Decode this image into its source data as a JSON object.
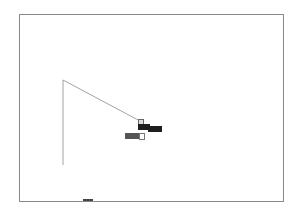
{
  "canvas": {
    "background": "#ffffff",
    "frame_color": "#8a8a8a",
    "line_color": "#8a8a8a"
  },
  "labels": {
    "label_a": "",
    "label_b": "",
    "field_value": ""
  },
  "colors": {
    "label_bg": "#1e1e1e",
    "field_bg": "#555555"
  }
}
